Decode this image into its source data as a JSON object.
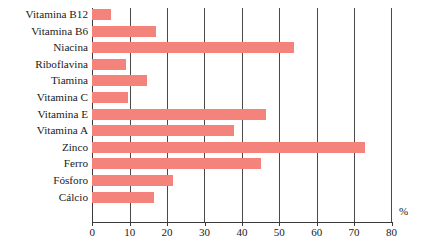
{
  "chart_data": {
    "type": "bar",
    "orientation": "horizontal",
    "title": "",
    "xlabel": "%",
    "ylabel": "",
    "xlim": [
      0,
      80
    ],
    "xticks": [
      0,
      10,
      20,
      30,
      40,
      50,
      60,
      70,
      80
    ],
    "grid": true,
    "legend": "none",
    "bar_color": "#F4837B",
    "categories": [
      "Vitamina B12",
      "Vitamina B6",
      "Niacina",
      "Riboflavina",
      "Tiamina",
      "Vitamina C",
      "Vitamina E",
      "Vitamina A",
      "Zinco",
      "Ferro",
      "Fósforo",
      "Cálcio"
    ],
    "values": [
      5,
      17,
      54,
      9,
      14.5,
      9.5,
      46.5,
      38,
      73,
      45,
      21.5,
      16.5
    ]
  }
}
